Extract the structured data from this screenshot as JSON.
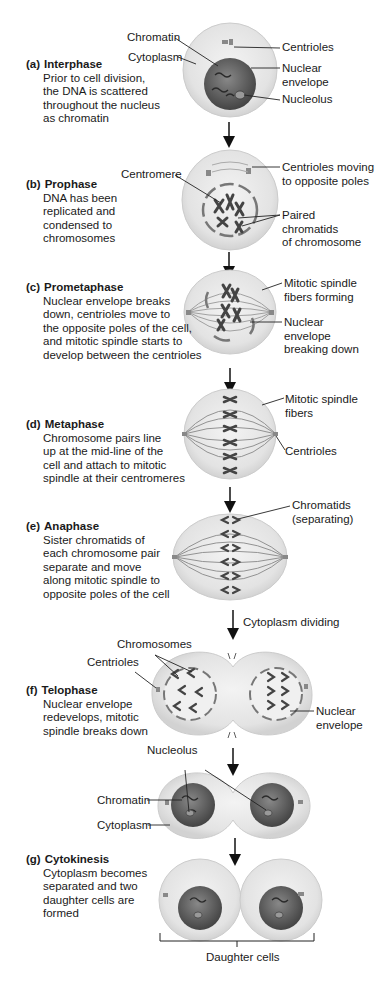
{
  "phases": [
    {
      "letter": "(a)",
      "title": "Interphase",
      "description": "Prior to cell division,\nthe DNA is scattered\nthroughout the nucleus\nas chromatin"
    },
    {
      "letter": "(b)",
      "title": "Prophase",
      "description": "DNA has been\nreplicated and\ncondensed to\nchromosomes"
    },
    {
      "letter": "(c)",
      "title": "Prometaphase",
      "description": "Nuclear envelope breaks\ndown, centrioles move to\nthe opposite poles of the cell,\nand mitotic spindle starts to\ndevelop between the centrioles"
    },
    {
      "letter": "(d)",
      "title": "Metaphase",
      "description": "Chromosome pairs line\nup at the mid-line of the\ncell and attach to mitotic\nspindle at their centromeres"
    },
    {
      "letter": "(e)",
      "title": "Anaphase",
      "description": "Sister chromatids of\neach chromosome pair\nseparate and move\nalong mitotic spindle to\nopposite poles of the cell"
    },
    {
      "letter": "(f)",
      "title": "Telophase",
      "description": "Nuclear envelope\nredevelops, mitotic\nspindle breaks down"
    },
    {
      "letter": "(g)",
      "title": "Cytokinesis",
      "description": "Cytoplasm becomes\nseparated and two\ndaughter cells are\nformed"
    }
  ],
  "labels": {
    "a_chromatin": "Chromatin",
    "a_cytoplasm": "Cytoplasm",
    "a_centrioles": "Centrioles",
    "a_nuclear_envelope": "Nuclear\nenvelope",
    "a_nucleolus": "Nucleolus",
    "b_centromere": "Centromere",
    "b_centrioles_moving": "Centrioles moving\nto opposite poles",
    "b_paired_chromatids": "Paired\nchromatids\nof chromosome",
    "c_spindle_forming": "Mitotic spindle\nfibers forming",
    "c_envelope_breaking": "Nuclear\nenvelope\nbreaking down",
    "d_spindle_fibers": "Mitotic spindle\nfibers",
    "d_centrioles": "Centrioles",
    "e_chromatids": "Chromatids\n(separating)",
    "e_cytoplasm_dividing": "Cytoplasm dividing",
    "f_chromosomes": "Chromosomes",
    "f_centrioles": "Centrioles",
    "f_nuclear_envelope": "Nuclear\nenvelope",
    "g_nucleolus": "Nucleolus",
    "g_chromatin": "Chromatin",
    "g_cytoplasm": "Cytoplasm",
    "daughter_cells": "Daughter cells"
  },
  "colors": {
    "cell_fill": "#e6e6e6",
    "cell_edge": "#c8c8c8",
    "nucleus": "#5a5a5a",
    "chromosome": "#555555",
    "line": "#222222"
  }
}
